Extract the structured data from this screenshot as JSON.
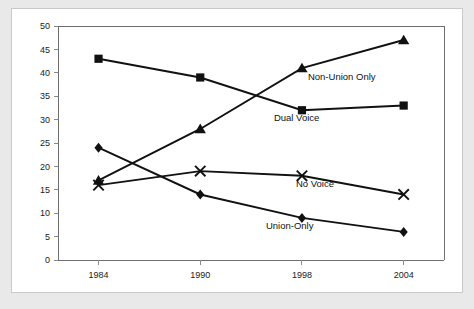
{
  "chart_data": {
    "type": "line",
    "title": "",
    "subtitle": "",
    "xlabel": "",
    "ylabel": "",
    "categories": [
      "1984",
      "1990",
      "1998",
      "2004"
    ],
    "x": [
      1984,
      1990,
      1998,
      2004
    ],
    "ylim": [
      0,
      50
    ],
    "ytick_step": 5,
    "yticks": [
      "0",
      "5",
      "10",
      "15",
      "20",
      "25",
      "30",
      "35",
      "40",
      "45",
      "50"
    ],
    "grid": false,
    "legend_position": "inline-annotations",
    "series": [
      {
        "name": "Dual Voice",
        "marker": "square",
        "values": [
          43,
          39,
          32,
          33
        ],
        "label_text": "Dual Voice",
        "label_anchor_x": 1998,
        "label_anchor_y": 29.6,
        "label_dx": -28,
        "label_dy": 0
      },
      {
        "name": "Non-Union Only",
        "marker": "triangle",
        "values": [
          17,
          28,
          41,
          47
        ],
        "label_text": "Non-Union Only",
        "label_anchor_x": 1998,
        "label_anchor_y": 38.5,
        "label_dx": 6,
        "label_dy": 0
      },
      {
        "name": "No Voice",
        "marker": "x",
        "values": [
          16,
          19,
          18,
          14
        ],
        "label_text": "No Voice",
        "label_anchor_x": 1998,
        "label_anchor_y": 15.7,
        "label_dx": -6,
        "label_dy": 0
      },
      {
        "name": "Union-Only",
        "marker": "diamond",
        "values": [
          24,
          14,
          9,
          6
        ],
        "label_text": "Union-Only",
        "label_anchor_x": 1998,
        "label_anchor_y": 6.6,
        "label_dx": -36,
        "label_dy": 0
      }
    ]
  },
  "style": {
    "frame_color": "#e9e9e9",
    "card_color": "#ffffff",
    "card_border_color": "#c9c9c9",
    "axis_color": "#6e6e6e",
    "ink_color": "#111111"
  }
}
